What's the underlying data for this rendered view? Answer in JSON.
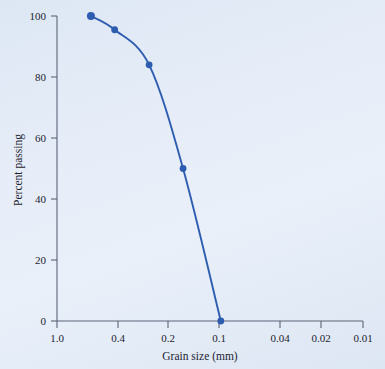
{
  "chart_data": {
    "type": "line",
    "title": "",
    "xlabel": "Grain size (mm)",
    "ylabel": "Percent passing",
    "x_scale": "log-reversed",
    "xlim": [
      1.0,
      0.01
    ],
    "ylim": [
      0,
      100
    ],
    "grid": false,
    "legend": false,
    "x_ticks": [
      "1.0",
      "0.4",
      "0.2",
      "0.1",
      "0.04",
      "0.02",
      "0.01"
    ],
    "x_tick_values": [
      1.0,
      0.4,
      0.2,
      0.1,
      0.04,
      0.02,
      0.01
    ],
    "y_ticks": [
      "0",
      "20",
      "40",
      "60",
      "80",
      "100"
    ],
    "y_tick_values": [
      0,
      20,
      40,
      60,
      80,
      100
    ],
    "series": [
      {
        "name": "Grain size distribution",
        "color": "#2d5cb0",
        "marker": "circle",
        "x": [
          0.6,
          0.42,
          0.25,
          0.15,
          0.085
        ],
        "y": [
          100,
          95.5,
          84,
          50,
          0
        ]
      }
    ]
  },
  "figure": {
    "background_color": "#e3ebf7",
    "axis_color": "#5a6476",
    "text_color": "#1c2430",
    "accent_color": "#2d5cb0"
  }
}
